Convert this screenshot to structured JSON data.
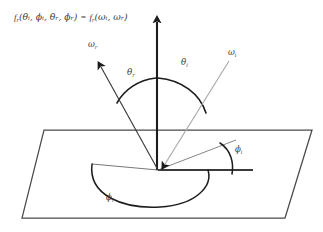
{
  "figure": {
    "title_formula": {
      "lhs_fn": "f",
      "lhs_fn_sub": "r",
      "lhs_args": "(θᵢ, ϕᵢ, θᵣ, ϕᵣ)",
      "equals": "=",
      "rhs_fn": "f",
      "rhs_fn_sub": "r",
      "rhs_args": "(ωᵢ, ωᵣ)",
      "full_text": "f_r(θ_i, ϕ_i, θ_r, ϕ_r) = f_r(ω_i, ω_r)"
    },
    "labels": {
      "omega_r": {
        "symbol": "ω",
        "sub": "r",
        "x": 93,
        "y": 45
      },
      "omega_i": {
        "symbol": "ω",
        "sub": "i",
        "x": 233,
        "y": 53
      },
      "theta_r": {
        "symbol": "θ",
        "sub": "r",
        "x": 131,
        "y": 73
      },
      "theta_i": {
        "symbol": "θ",
        "sub": "i",
        "x": 185,
        "y": 63
      },
      "phi_i": {
        "symbol": "ϕ",
        "sub": "i",
        "x": 238,
        "y": 150
      },
      "phi_r": {
        "symbol": "ϕ",
        "sub": "r",
        "x": 110,
        "y": 198
      }
    },
    "geometry": {
      "origin": {
        "x": 158,
        "y": 170
      },
      "normal_tip": {
        "x": 157,
        "y": 14
      },
      "outgoing_tip": {
        "x": 95,
        "y": 60
      },
      "incoming_start": {
        "x": 229,
        "y": 61
      },
      "plane_corners": "44,130 312,130 285,218 22,218",
      "azimuth_ref_right": {
        "x": 253,
        "y": 170
      },
      "azimuth_incoming_proj": {
        "x": 236,
        "y": 140
      },
      "azimuth_outgoing_proj": {
        "x": 92,
        "y": 164
      }
    },
    "colors": {
      "ink": "#2b2b2b",
      "ray_gray": "#a9a9a9",
      "plane_line": "#4a4a4a",
      "text": "#3c3c3c",
      "background": "#ffffff"
    },
    "caption": "BRDF geometry: incident and reflected directions over a surface plane"
  }
}
